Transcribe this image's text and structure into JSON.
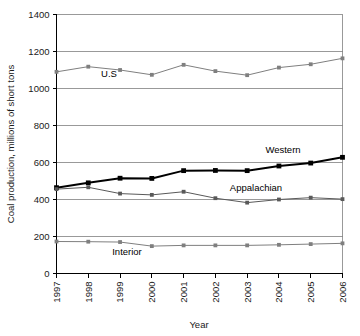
{
  "chart_data": {
    "type": "line",
    "title": "",
    "xlabel": "Year",
    "ylabel": "Coal production, millions of short tons",
    "x": [
      1997,
      1998,
      1999,
      2000,
      2001,
      2002,
      2003,
      2004,
      2005,
      2006
    ],
    "categories": [
      "1997",
      "1998",
      "1999",
      "2000",
      "2001",
      "2002",
      "2003",
      "2004",
      "2005",
      "2006"
    ],
    "xlim": [
      1997,
      2006
    ],
    "ylim": [
      0,
      1400
    ],
    "yticks": [
      0,
      200,
      400,
      600,
      800,
      1000,
      1200,
      1400
    ],
    "ytick_labels": [
      "0",
      "200",
      "400",
      "600",
      "800",
      "1000",
      "1200",
      "1400"
    ],
    "grid": true,
    "legend_position": "inline-annotations",
    "series": [
      {
        "name": "U.S",
        "color": "#7f7f7f",
        "marker": "square",
        "linewidth": 1,
        "values": [
          1090,
          1118,
          1100,
          1074,
          1128,
          1094,
          1072,
          1113,
          1131,
          1163
        ]
      },
      {
        "name": "Western",
        "color": "#000000",
        "marker": "square",
        "linewidth": 2,
        "values": [
          464,
          490,
          515,
          514,
          556,
          557,
          556,
          581,
          597,
          628
        ]
      },
      {
        "name": "Appalachian",
        "color": "#595959",
        "marker": "square",
        "linewidth": 1,
        "values": [
          456,
          466,
          432,
          425,
          442,
          407,
          383,
          400,
          410,
          402
        ]
      },
      {
        "name": "Interior",
        "color": "#7f7f7f",
        "marker": "square",
        "linewidth": 1,
        "values": [
          173,
          172,
          170,
          148,
          152,
          152,
          152,
          155,
          159,
          163
        ]
      }
    ],
    "annotations": [
      {
        "label": "U.S",
        "x_px": 109,
        "y_px": 77
      },
      {
        "label": "Western",
        "x_px": 283,
        "y_px": 153
      },
      {
        "label": "Appalachian",
        "x_px": 256,
        "y_px": 191
      },
      {
        "label": "Interior",
        "x_px": 127,
        "y_px": 255
      }
    ]
  },
  "axes": {
    "y_title": "Coal production, millions of short tons",
    "x_title": "Year"
  }
}
